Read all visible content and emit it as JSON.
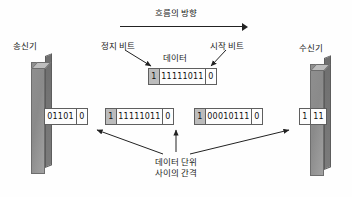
{
  "diagram": {
    "title_flow": "흐름의 방향",
    "endpoints": {
      "transmitter": "송신기",
      "receiver": "수신기"
    },
    "callouts": {
      "stop_bit": "정지 비트",
      "data": "데이터",
      "start_bit": "시작 비트",
      "gap_line1": "데이터 단위",
      "gap_line2": "사이의 간격"
    },
    "detail_frame": {
      "stop_bit": "1",
      "data_bits": "11111011",
      "start_bit": "0"
    },
    "stream_frames": [
      {
        "stop_bit": "",
        "data_bits": "01101",
        "start_bit": "0"
      },
      {
        "stop_bit": "1",
        "data_bits": "11111011",
        "start_bit": "0"
      },
      {
        "stop_bit": "1",
        "data_bits": "00010111",
        "start_bit": "0"
      },
      {
        "stop_bit": "1",
        "data_bits": "11",
        "start_bit": ""
      }
    ],
    "colors": {
      "stop_bit_fill": "#bcbcbc",
      "cell_border": "#5f5f5f",
      "line": "#222222",
      "slab_front": "#8f8f8f",
      "slab_top": "#bdbdbd",
      "slab_side": "#6f6f6f"
    }
  }
}
